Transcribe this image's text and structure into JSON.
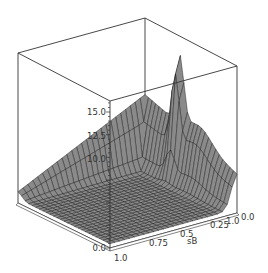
{
  "chart_data": {
    "type": "surface3d",
    "title": "",
    "xlabel": "",
    "ylabel": "sB",
    "zlabel": "",
    "x_ticks": [
      "0.0",
      "1.0"
    ],
    "y_ticks": [
      "1.0",
      "0.75",
      "0.5",
      "0.25"
    ],
    "z_ticks": [
      "0.0",
      "10.0",
      "12.5",
      "15.0"
    ],
    "z_ticks_all": [
      0.0,
      2.5,
      5.0,
      7.5,
      10.0,
      12.5,
      15.0
    ],
    "zlim": [
      0,
      17
    ],
    "xlim": [
      0,
      1
    ],
    "ylim": [
      0,
      1
    ],
    "grid_resolution": 26,
    "surface_color": "#8a8a8a",
    "mesh_color": "#1e1e1e",
    "box_color": "#333333",
    "features": [
      {
        "name": "flat-floor",
        "z": 0.5
      },
      {
        "name": "back-ridge",
        "z": 8.8
      },
      {
        "name": "peak",
        "z": 16.5,
        "x": 0.95,
        "sB": 0.05
      }
    ]
  },
  "axes": {
    "z_label_15": "15.0",
    "z_label_125": "12.5",
    "z_label_10": "10.0",
    "z_label_0": "0.0",
    "x_label_0": "0.0",
    "x_label_1": "1.0",
    "y_label_1": "1.0",
    "y_label_075": "0.75",
    "y_label_05": "0.5",
    "y_label_025": "0.25",
    "y_title": "sB",
    "right_z0": "0.0"
  }
}
